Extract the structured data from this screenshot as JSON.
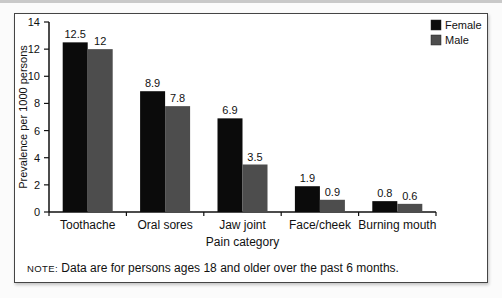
{
  "page": {
    "note_prefix": "NOTE:",
    "note_text": " Data are for persons ages 18 and older over the past 6 months."
  },
  "chart_data": {
    "type": "bar",
    "title": "",
    "categories": [
      "Toothache",
      "Oral sores",
      "Jaw joint",
      "Face/cheek",
      "Burning mouth"
    ],
    "series": [
      {
        "name": "Female",
        "color": "#0b0b0b",
        "values": [
          12.5,
          8.9,
          6.9,
          1.9,
          0.8
        ]
      },
      {
        "name": "Male",
        "color": "#4d4d4d",
        "values": [
          12,
          7.8,
          3.5,
          0.9,
          0.6
        ]
      }
    ],
    "xlabel": "Pain category",
    "ylabel": "Prevalence per 1000 persons",
    "ylim": [
      0,
      14
    ],
    "ytick_step": 2,
    "legend_position": "top-right",
    "grid": false,
    "value_labels": true,
    "axis_color": "#111111",
    "text_color": "#111111"
  }
}
